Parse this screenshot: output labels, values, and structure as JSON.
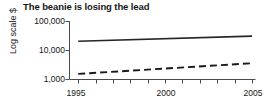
{
  "chart_data": {
    "type": "line",
    "title": "The beanie is losing the lead",
    "xlabel": "",
    "ylabel": "Log scale $",
    "yscale": "log",
    "ylim": [
      1000,
      100000
    ],
    "xlim": [
      1994.5,
      2005.2
    ],
    "grid": false,
    "legend": "none",
    "ytick_labels": [
      "1,000",
      "10,000",
      "100,000"
    ],
    "ytick_values": [
      1000,
      10000,
      100000
    ],
    "xtick_labels": [
      "1995",
      "2000",
      "2005"
    ],
    "xtick_values": [
      1995,
      2000,
      2005
    ],
    "x_minor_ticks": [
      1995,
      1996,
      1997,
      1998,
      1999,
      2000,
      2001,
      2002,
      2003,
      2004,
      2005
    ],
    "x": [
      1995,
      2005
    ],
    "series": [
      {
        "name": "solid-series",
        "style": "solid",
        "color": "#262626",
        "values": [
          20000,
          30000
        ]
      },
      {
        "name": "dashed-series",
        "style": "dashed",
        "color": "#1a1a1a",
        "values": [
          1500,
          3500
        ]
      }
    ]
  },
  "figure": {
    "title": "The beanie is losing the lead",
    "y_axis_label": "Log scale $",
    "y_ticks": [
      {
        "label": "100,000"
      },
      {
        "label": "10,000"
      },
      {
        "label": "1,000"
      }
    ],
    "x_ticks": [
      {
        "label": "1995"
      },
      {
        "label": "2000"
      },
      {
        "label": "2005"
      }
    ]
  }
}
